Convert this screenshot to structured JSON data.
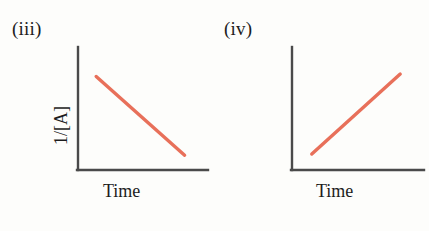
{
  "figure": {
    "background_color": "#fdfdfb",
    "axis_color": "#4a4a4a",
    "line_color": "#e8705a"
  },
  "panels": [
    {
      "label": "(iii)",
      "x_axis_title": "Time",
      "y_axis_title": "1/[A]"
    },
    {
      "label": "(iv)",
      "x_axis_title": "Time",
      "y_axis_title": "1/[A]"
    }
  ],
  "chart_data": [
    {
      "type": "line",
      "title": "(iii)",
      "xlabel": "Time",
      "ylabel": "1/[A]",
      "xlim": [
        0,
        10
      ],
      "ylim": [
        0,
        10
      ],
      "grid": false,
      "legend": "none",
      "series": [
        {
          "name": "1/[A] vs Time (decreasing)",
          "color": "#e8705a",
          "trend": "decreasing",
          "x": [
            1.4,
            8.2
          ],
          "y": [
            7.6,
            1.2
          ]
        }
      ],
      "axis_ticks": {
        "x": [],
        "y": []
      },
      "annotation": "Straight line with negative slope"
    },
    {
      "type": "line",
      "title": "(iv)",
      "xlabel": "Time",
      "ylabel": "1/[A]",
      "xlim": [
        0,
        10
      ],
      "ylim": [
        0,
        10
      ],
      "grid": false,
      "legend": "none",
      "series": [
        {
          "name": "1/[A] vs Time (increasing)",
          "color": "#e8705a",
          "trend": "increasing",
          "x": [
            1.5,
            8.2
          ],
          "y": [
            1.3,
            7.8
          ]
        }
      ],
      "axis_ticks": {
        "x": [],
        "y": []
      },
      "annotation": "Straight line with positive slope"
    }
  ]
}
